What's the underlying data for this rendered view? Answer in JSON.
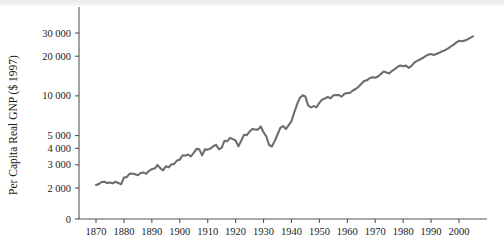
{
  "chart_data": {
    "type": "line",
    "title": "",
    "xlabel": "",
    "ylabel": "Per Capita Real GNP ($ 1997)",
    "yscale": "log",
    "xscale": "linear",
    "grid": false,
    "legend": "none",
    "xlim": [
      1866,
      2006
    ],
    "ylim": [
      1800,
      38000
    ],
    "y_tick_labels": [
      "0",
      "2 000",
      "3 000",
      "4 000",
      "5 000",
      "10 000",
      "20 000",
      "30 000"
    ],
    "y_tick_values": [
      0,
      2000,
      3000,
      4000,
      5000,
      10000,
      20000,
      30000
    ],
    "x_tick_labels": [
      "1870",
      "1880",
      "1890",
      "1900",
      "1910",
      "1920",
      "1930",
      "1940",
      "1950",
      "1960",
      "1970",
      "1980",
      "1990",
      "2000"
    ],
    "x_tick_values": [
      1870,
      1880,
      1890,
      1900,
      1910,
      1920,
      1930,
      1940,
      1950,
      1960,
      1970,
      1980,
      1990,
      2000
    ],
    "series": [
      {
        "name": "Per Capita Real GNP",
        "color": "#6d6d6d",
        "x": [
          1870,
          1871,
          1872,
          1873,
          1874,
          1875,
          1876,
          1877,
          1878,
          1879,
          1880,
          1881,
          1882,
          1883,
          1884,
          1885,
          1886,
          1887,
          1888,
          1889,
          1890,
          1891,
          1892,
          1893,
          1894,
          1895,
          1896,
          1897,
          1898,
          1899,
          1900,
          1901,
          1902,
          1903,
          1904,
          1905,
          1906,
          1907,
          1908,
          1909,
          1910,
          1911,
          1912,
          1913,
          1914,
          1915,
          1916,
          1917,
          1918,
          1919,
          1920,
          1921,
          1922,
          1923,
          1924,
          1925,
          1926,
          1927,
          1928,
          1929,
          1930,
          1931,
          1932,
          1933,
          1934,
          1935,
          1936,
          1937,
          1938,
          1939,
          1940,
          1941,
          1942,
          1943,
          1944,
          1945,
          1946,
          1947,
          1948,
          1949,
          1950,
          1951,
          1952,
          1953,
          1954,
          1955,
          1956,
          1957,
          1958,
          1959,
          1960,
          1961,
          1962,
          1963,
          1964,
          1965,
          1966,
          1967,
          1968,
          1969,
          1970,
          1971,
          1972,
          1973,
          1974,
          1975,
          1976,
          1977,
          1978,
          1979,
          1980,
          1981,
          1982,
          1983,
          1984,
          1985,
          1986,
          1987,
          1988,
          1989,
          1990,
          1991,
          1992,
          1993,
          1994,
          1995,
          1996,
          1997,
          1998,
          1999,
          2000,
          2001,
          2002,
          2003,
          2004,
          2005
        ],
        "y": [
          2110,
          2140,
          2220,
          2230,
          2180,
          2200,
          2170,
          2230,
          2180,
          2130,
          2400,
          2420,
          2560,
          2580,
          2540,
          2500,
          2600,
          2620,
          2570,
          2700,
          2780,
          2810,
          2990,
          2830,
          2720,
          2920,
          2870,
          3020,
          3050,
          3230,
          3280,
          3540,
          3520,
          3590,
          3470,
          3690,
          3960,
          3930,
          3540,
          3930,
          3910,
          3980,
          4150,
          4260,
          3940,
          4030,
          4560,
          4520,
          4800,
          4700,
          4590,
          4140,
          4560,
          5070,
          5040,
          5360,
          5600,
          5550,
          5550,
          5860,
          5300,
          4920,
          4240,
          4130,
          4540,
          5090,
          5710,
          5900,
          5600,
          5990,
          6430,
          7480,
          8610,
          9650,
          10100,
          9880,
          8420,
          8180,
          8360,
          8200,
          8860,
          9380,
          9540,
          9820,
          9570,
          10100,
          10150,
          10140,
          9870,
          10370,
          10500,
          10560,
          10980,
          11280,
          11740,
          12310,
          12950,
          13130,
          13610,
          13870,
          13720,
          14020,
          14620,
          15300,
          15030,
          14810,
          15450,
          15960,
          16630,
          17000,
          16760,
          16960,
          16330,
          16880,
          17880,
          18430,
          18890,
          19370,
          20000,
          20560,
          20770,
          20400,
          20850,
          21220,
          21850,
          22210,
          22840,
          23610,
          24410,
          25320,
          26170,
          25960,
          26260,
          26810,
          27580,
          28300
        ]
      }
    ]
  },
  "axes": {
    "y_title": "Per Capita Real GNP ($ 1997)"
  }
}
